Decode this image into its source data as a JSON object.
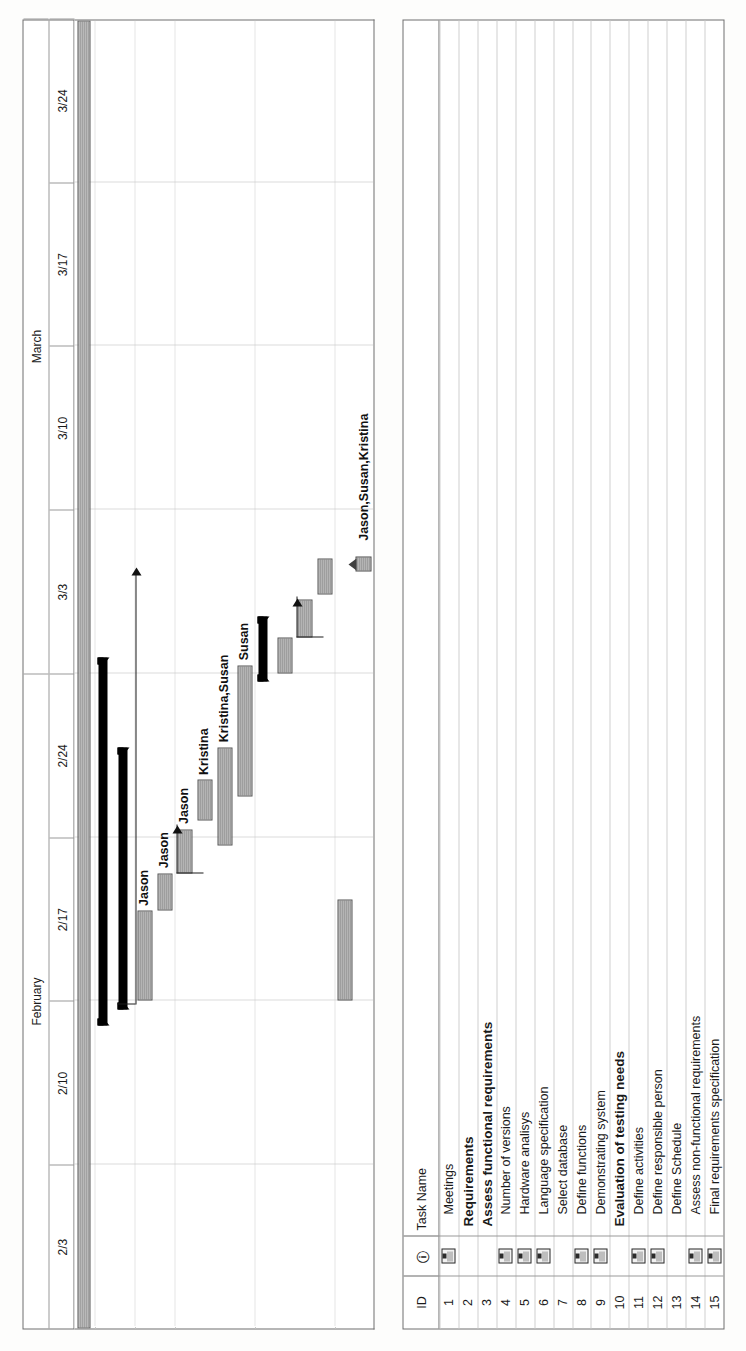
{
  "app": {
    "kind": "gantt-chart",
    "orientation": "landscape-page-rotated-90ccw"
  },
  "table": {
    "columns": [
      {
        "key": "id",
        "label": "ID"
      },
      {
        "key": "indicator",
        "label": "i"
      },
      {
        "key": "name",
        "label": "Task Name"
      }
    ],
    "rows": [
      {
        "id": "1",
        "indicator": "note-icon",
        "name": "Meetings",
        "bold": false
      },
      {
        "id": "2",
        "indicator": "",
        "name": "Requirements",
        "bold": true
      },
      {
        "id": "3",
        "indicator": "",
        "name": "Assess functional requirements",
        "bold": true
      },
      {
        "id": "4",
        "indicator": "note-icon",
        "name": "Number of versions",
        "bold": false
      },
      {
        "id": "5",
        "indicator": "note-icon",
        "name": "Hardware analisys",
        "bold": false
      },
      {
        "id": "6",
        "indicator": "note-icon",
        "name": "Language specification",
        "bold": false
      },
      {
        "id": "7",
        "indicator": "",
        "name": "Select database",
        "bold": false
      },
      {
        "id": "8",
        "indicator": "note-icon",
        "name": "Define functions",
        "bold": false
      },
      {
        "id": "9",
        "indicator": "note-icon",
        "name": "Demonstrating system",
        "bold": false
      },
      {
        "id": "10",
        "indicator": "",
        "name": "Evaluation of testing needs",
        "bold": true
      },
      {
        "id": "11",
        "indicator": "note-icon",
        "name": "Define activities",
        "bold": false
      },
      {
        "id": "12",
        "indicator": "note-icon",
        "name": "Define responsible person",
        "bold": false
      },
      {
        "id": "13",
        "indicator": "",
        "name": "Define Schedule",
        "bold": false
      },
      {
        "id": "14",
        "indicator": "note-icon",
        "name": "Assess non-functional requirements",
        "bold": false
      },
      {
        "id": "15",
        "indicator": "note-icon",
        "name": "Final requirements specification",
        "bold": false
      }
    ]
  },
  "timeline": {
    "months": [
      {
        "label": "February",
        "span": 4
      },
      {
        "label": "March",
        "span": 4
      }
    ],
    "weeks": [
      "2/3",
      "2/10",
      "2/17",
      "2/24",
      "3/3",
      "3/10",
      "3/17",
      "3/24"
    ]
  },
  "chart_data": {
    "type": "gantt",
    "title": "",
    "xlabel": "",
    "ylabel": "",
    "x_ticks": [
      "2/3",
      "2/10",
      "2/17",
      "2/24",
      "3/3",
      "3/10",
      "3/17",
      "3/24"
    ],
    "grid": true,
    "bars": [
      {
        "row": 1,
        "task": "Meetings",
        "kind": "task",
        "start_week": 0.05,
        "end_week": 8.0,
        "resource": ""
      },
      {
        "row": 2,
        "task": "Requirements",
        "kind": "summary",
        "start_week": 1.85,
        "end_week": 4.1,
        "resource": ""
      },
      {
        "row": 3,
        "task": "Assess functional requirements",
        "kind": "summary",
        "start_week": 1.95,
        "end_week": 3.55,
        "resource": ""
      },
      {
        "row": 4,
        "task": "Number of versions",
        "kind": "task",
        "start_week": 2.0,
        "end_week": 2.55,
        "resource": "Jason"
      },
      {
        "row": 5,
        "task": "Hardware analisys",
        "kind": "task",
        "start_week": 2.55,
        "end_week": 2.78,
        "resource": "Jason"
      },
      {
        "row": 6,
        "task": "Language specification",
        "kind": "task",
        "start_week": 2.78,
        "end_week": 3.05,
        "resource": "Jason"
      },
      {
        "row": 7,
        "task": "Select database",
        "kind": "task",
        "start_week": 3.1,
        "end_week": 3.35,
        "resource": "Kristina"
      },
      {
        "row": 8,
        "task": "Define functions",
        "kind": "task",
        "start_week": 2.95,
        "end_week": 3.55,
        "resource": "Kristina,Susan"
      },
      {
        "row": 9,
        "task": "Demonstrating system",
        "kind": "task",
        "start_week": 3.25,
        "end_week": 4.05,
        "resource": "Susan"
      },
      {
        "row": 10,
        "task": "Evaluation of testing needs",
        "kind": "summary",
        "start_week": 3.95,
        "end_week": 4.35,
        "resource": ""
      },
      {
        "row": 11,
        "task": "Define activities",
        "kind": "task",
        "start_week": 4.0,
        "end_week": 4.22,
        "resource": ""
      },
      {
        "row": 12,
        "task": "Define responsible person",
        "kind": "task",
        "start_week": 4.22,
        "end_week": 4.45,
        "resource": ""
      },
      {
        "row": 13,
        "task": "Define Schedule",
        "kind": "task",
        "start_week": 4.48,
        "end_week": 4.7,
        "resource": ""
      },
      {
        "row": 14,
        "task": "Assess non-functional requirements",
        "kind": "task",
        "start_week": 2.0,
        "end_week": 2.62,
        "resource": ""
      },
      {
        "row": 15,
        "task": "Final requirements specification",
        "kind": "milestone",
        "start_week": 4.62,
        "end_week": 4.78,
        "resource": "Jason,Susan,Kristina"
      }
    ],
    "resource_labels": [
      "Jason",
      "Jason",
      "Jason",
      "Kristina",
      "Kristina,Susan",
      "Susan",
      "Jason,Susan,Kristina"
    ]
  },
  "colors": {
    "bar_fill": "#adadad",
    "bar_border": "#555555",
    "summary": "#000000",
    "grid": "#b9b9b9",
    "text": "#1a1a1a",
    "paper": "#fdfdfc"
  }
}
